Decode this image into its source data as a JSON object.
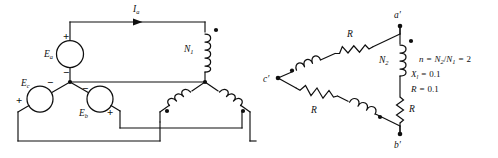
{
  "figure": {
    "stroke_color": "#0f0f0f",
    "background_color": "#ffffff"
  },
  "left_circuit": {
    "name": "wye-connected source with primary windings",
    "current_label": "I",
    "current_sub": "a",
    "sources": [
      {
        "label": "E",
        "sub": "a",
        "plus": "+",
        "minus": "−"
      },
      {
        "label": "E",
        "sub": "b",
        "plus": "+",
        "minus": "−"
      },
      {
        "label": "E",
        "sub": "c",
        "plus": "+",
        "minus": "−"
      }
    ],
    "primary_winding": {
      "label": "N",
      "sub": "1"
    }
  },
  "right_circuit": {
    "name": "delta-connected secondary",
    "vertices": [
      {
        "label": "a",
        "prime": "′"
      },
      {
        "label": "b",
        "prime": "′"
      },
      {
        "label": "c",
        "prime": "′"
      }
    ],
    "secondary_winding": {
      "label": "N",
      "sub": "2"
    },
    "resistor_labels": [
      "R",
      "R",
      "R"
    ]
  },
  "annotations": {
    "line1_lhs": "n",
    "line1_rhs": "N",
    "line1_sub_num": "2",
    "line1_den": "N",
    "line1_sub_den": "1",
    "line1_value": "2",
    "line2_lhs": "X",
    "line2_sub": "l",
    "line2_value": "0.1",
    "line3_lhs": "R",
    "line3_value": "0.1",
    "equals": "=",
    "slash": "/"
  }
}
